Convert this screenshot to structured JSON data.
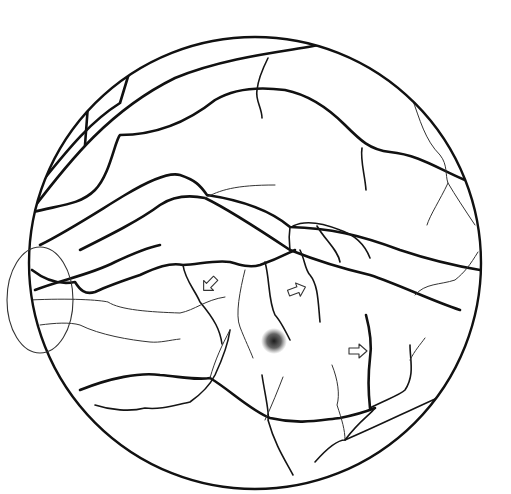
{
  "figure": {
    "elements": {
      "fundus_border": "circular retina outline",
      "optic_disc": "optic disc at left edge",
      "macula": "stippled fovea spot at center",
      "arrows": [
        {
          "id": "arrow-1",
          "direction": "down-left",
          "icon": "hollow-arrow-icon"
        },
        {
          "id": "arrow-2",
          "direction": "right",
          "icon": "hollow-arrow-icon"
        },
        {
          "id": "arrow-3",
          "direction": "right",
          "icon": "hollow-arrow-icon"
        }
      ]
    },
    "colors": {
      "line": "#111111",
      "fine_line": "#333333",
      "background": "#ffffff"
    }
  }
}
